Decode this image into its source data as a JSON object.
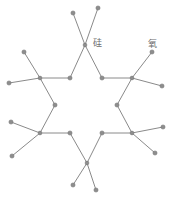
{
  "figure": {
    "background_color": "#ffffff",
    "bond_color": "#8a8a8a",
    "node_fill_color": "#8d8d8d",
    "node_stroke_color": "#6f6f6f",
    "label_color": "#6e6e6e"
  },
  "labels": {
    "silicon": "硅",
    "oxygen": "氧"
  },
  "chart_data": {
    "type": "diagram",
    "xlabel": "",
    "ylabel": "",
    "nodes": [
      {
        "id": "si-top",
        "x": 85,
        "y": 45,
        "role": "silicon-center",
        "ring": "vertex"
      },
      {
        "id": "si-upper-left",
        "x": 40,
        "y": 78,
        "role": "silicon-center",
        "ring": "vertex"
      },
      {
        "id": "si-upper-right",
        "x": 132,
        "y": 78,
        "role": "silicon-center",
        "ring": "vertex"
      },
      {
        "id": "si-lower-left",
        "x": 40,
        "y": 133,
        "role": "silicon-center",
        "ring": "vertex"
      },
      {
        "id": "si-lower-right",
        "x": 132,
        "y": 133,
        "role": "silicon-center",
        "ring": "vertex"
      },
      {
        "id": "si-bottom",
        "x": 87,
        "y": 163,
        "role": "silicon-center",
        "ring": "vertex"
      },
      {
        "id": "o-top-left",
        "x": 70,
        "y": 78,
        "role": "oxygen-bridge",
        "ring": "inner"
      },
      {
        "id": "o-top-right",
        "x": 102,
        "y": 78,
        "role": "oxygen-bridge",
        "ring": "inner"
      },
      {
        "id": "o-mid-left",
        "x": 55,
        "y": 105,
        "role": "oxygen-bridge",
        "ring": "inner"
      },
      {
        "id": "o-mid-right",
        "x": 117,
        "y": 105,
        "role": "oxygen-bridge",
        "ring": "inner"
      },
      {
        "id": "o-bot-left",
        "x": 70,
        "y": 133,
        "role": "oxygen-bridge",
        "ring": "inner"
      },
      {
        "id": "o-bot-right",
        "x": 102,
        "y": 133,
        "role": "oxygen-bridge",
        "ring": "inner"
      },
      {
        "id": "t-top-a",
        "x": 73,
        "y": 13,
        "role": "oxygen-terminal",
        "ring": "outer"
      },
      {
        "id": "t-top-b",
        "x": 98,
        "y": 8,
        "role": "oxygen-terminal",
        "ring": "outer"
      },
      {
        "id": "t-ul-a",
        "x": 24,
        "y": 52,
        "role": "oxygen-terminal",
        "ring": "outer"
      },
      {
        "id": "t-ul-b",
        "x": 9,
        "y": 83,
        "role": "oxygen-terminal",
        "ring": "outer"
      },
      {
        "id": "t-ur-a",
        "x": 152,
        "y": 52,
        "role": "oxygen-terminal",
        "ring": "outer"
      },
      {
        "id": "t-ur-b",
        "x": 162,
        "y": 86,
        "role": "oxygen-terminal",
        "ring": "outer"
      },
      {
        "id": "t-ll-a",
        "x": 11,
        "y": 122,
        "role": "oxygen-terminal",
        "ring": "outer"
      },
      {
        "id": "t-ll-b",
        "x": 12,
        "y": 156,
        "role": "oxygen-terminal",
        "ring": "outer"
      },
      {
        "id": "t-lr-a",
        "x": 163,
        "y": 127,
        "role": "oxygen-terminal",
        "ring": "outer"
      },
      {
        "id": "t-lr-b",
        "x": 155,
        "y": 153,
        "role": "oxygen-terminal",
        "ring": "outer"
      },
      {
        "id": "t-bot-a",
        "x": 73,
        "y": 185,
        "role": "oxygen-terminal",
        "ring": "outer"
      },
      {
        "id": "t-bot-b",
        "x": 96,
        "y": 190,
        "role": "oxygen-terminal",
        "ring": "outer"
      }
    ],
    "edges": [
      [
        "si-top",
        "o-top-left"
      ],
      [
        "si-top",
        "o-top-right"
      ],
      [
        "si-top",
        "t-top-b"
      ],
      [
        "si-top",
        "t-top-a"
      ],
      [
        "si-upper-left",
        "o-top-left"
      ],
      [
        "si-upper-left",
        "o-mid-left"
      ],
      [
        "si-upper-left",
        "t-ul-a"
      ],
      [
        "si-upper-left",
        "t-ul-b"
      ],
      [
        "si-upper-right",
        "o-top-right"
      ],
      [
        "si-upper-right",
        "o-mid-right"
      ],
      [
        "si-upper-right",
        "t-ur-a"
      ],
      [
        "si-upper-right",
        "t-ur-b"
      ],
      [
        "si-lower-left",
        "o-mid-left"
      ],
      [
        "si-lower-left",
        "o-bot-left"
      ],
      [
        "si-lower-left",
        "t-ll-a"
      ],
      [
        "si-lower-left",
        "t-ll-b"
      ],
      [
        "si-lower-right",
        "o-mid-right"
      ],
      [
        "si-lower-right",
        "o-bot-right"
      ],
      [
        "si-lower-right",
        "t-lr-a"
      ],
      [
        "si-lower-right",
        "t-lr-b"
      ],
      [
        "si-bottom",
        "o-bot-left"
      ],
      [
        "si-bottom",
        "o-bot-right"
      ],
      [
        "si-bottom",
        "t-bot-a"
      ],
      [
        "si-bottom",
        "t-bot-b"
      ]
    ],
    "annotations": [
      {
        "text": "硅",
        "x": 93,
        "y": 44,
        "target": "si-top"
      },
      {
        "text": "氧",
        "x": 148,
        "y": 45,
        "target": "t-ur-a"
      }
    ]
  }
}
